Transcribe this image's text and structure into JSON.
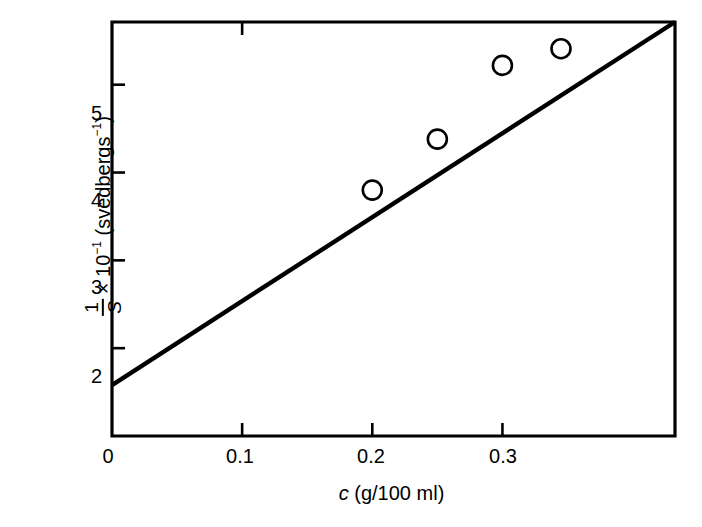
{
  "chart_data": {
    "type": "scatter",
    "title": "",
    "xlabel": "c (g/100 ml)",
    "xlabel_parts": {
      "symbol": "c",
      "units": " (g/100 ml)"
    },
    "ylabel": "1/S × 10-1 (svedbergs-1)",
    "ylabel_parts": {
      "fraction_numerator": "1",
      "fraction_denominator": "S",
      "multiplier": "× 10",
      "multiplier_exponent": "−1",
      "units": "(svedbergs",
      "units_exponent": "−1",
      "units_close": ")"
    },
    "xlim": [
      0,
      0.4326
    ],
    "ylim": [
      1.0,
      5.714
    ],
    "xticks": [
      0,
      0.1,
      0.2,
      0.3
    ],
    "xtick_labels": [
      "0",
      "0.1",
      "0.2",
      "0.3"
    ],
    "yticks": [
      2,
      3,
      4,
      5
    ],
    "ytick_labels": [
      "2",
      "3",
      "4",
      "5"
    ],
    "grid": false,
    "legend": null,
    "marker": "open-circle",
    "marker_color": "#000000",
    "line_color": "#000000",
    "frame": true,
    "points": [
      {
        "x": 0.2,
        "y": 3.8
      },
      {
        "x": 0.25,
        "y": 4.38
      },
      {
        "x": 0.3,
        "y": 5.22
      },
      {
        "x": 0.345,
        "y": 5.41
      }
    ],
    "fit_line": {
      "x_start": 0.0,
      "y_start": 1.58,
      "x_end": 0.4326,
      "y_end": 5.714,
      "intercept": 1.58,
      "slope": 9.55
    }
  },
  "figure": {
    "caption": "",
    "background_color": "#ffffff"
  }
}
